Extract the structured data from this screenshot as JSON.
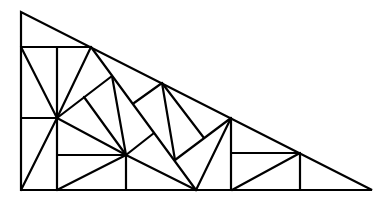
{
  "diagram": {
    "title": "",
    "stroke_color": "#000000",
    "background_color": "#ffffff",
    "outer_triangle": [
      [
        21,
        12
      ],
      [
        21,
        190
      ],
      [
        372,
        190
      ]
    ],
    "points": {
      "A": [
        57,
        118
      ],
      "B": [
        126,
        155
      ],
      "C": [
        91,
        47
      ],
      "D": [
        112,
        76
      ],
      "E": [
        162,
        83
      ],
      "F": [
        175,
        160
      ],
      "G": [
        231,
        118
      ],
      "H": [
        196,
        190
      ],
      "J": [
        300,
        153
      ]
    },
    "segments": [
      [
        [
          21,
          47
        ],
        [
          91,
          47
        ]
      ],
      [
        [
          57,
          47
        ],
        [
          57,
          190
        ]
      ],
      [
        [
          21,
          47
        ],
        [
          57,
          118
        ]
      ],
      [
        [
          91,
          47
        ],
        [
          57,
          118
        ]
      ],
      [
        [
          21,
          118
        ],
        [
          57,
          118
        ]
      ],
      [
        [
          57,
          118
        ],
        [
          21,
          190
        ]
      ],
      [
        [
          57,
          118
        ],
        [
          126,
          155
        ]
      ],
      [
        [
          57,
          155
        ],
        [
          126,
          155
        ]
      ],
      [
        [
          57,
          190
        ],
        [
          126,
          155
        ]
      ],
      [
        [
          126,
          155
        ],
        [
          126,
          190
        ]
      ],
      [
        [
          112,
          76
        ],
        [
          57,
          118
        ]
      ],
      [
        [
          112,
          76
        ],
        [
          126,
          155
        ]
      ],
      [
        [
          84,
          97
        ],
        [
          126,
          155
        ]
      ],
      [
        [
          91,
          47
        ],
        [
          196,
          190
        ]
      ],
      [
        [
          162,
          83
        ],
        [
          134,
          103
        ]
      ],
      [
        [
          162,
          83
        ],
        [
          175,
          160
        ]
      ],
      [
        [
          162,
          83
        ],
        [
          204,
          138
        ]
      ],
      [
        [
          126,
          155
        ],
        [
          154,
          133
        ]
      ],
      [
        [
          126,
          155
        ],
        [
          196,
          190
        ]
      ],
      [
        [
          175,
          160
        ],
        [
          231,
          118
        ]
      ],
      [
        [
          196,
          190
        ],
        [
          231,
          118
        ]
      ],
      [
        [
          231,
          118
        ],
        [
          231,
          190
        ]
      ],
      [
        [
          231,
          153
        ],
        [
          300,
          153
        ]
      ],
      [
        [
          232,
          190
        ],
        [
          300,
          153
        ]
      ],
      [
        [
          300,
          153
        ],
        [
          300,
          190
        ]
      ]
    ]
  }
}
